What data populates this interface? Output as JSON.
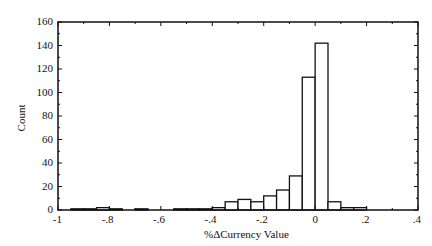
{
  "chart_data": {
    "type": "bar",
    "title": "",
    "xlabel": "%ΔCurrency Value",
    "ylabel": "Count",
    "xlim": [
      -1,
      0.4
    ],
    "ylim": [
      0,
      160
    ],
    "xticks": [
      "-1",
      "-.8",
      "-.6",
      "-.4",
      "-.2",
      "0",
      ".2",
      ".4"
    ],
    "xtick_values": [
      -1,
      -0.8,
      -0.6,
      -0.4,
      -0.2,
      0,
      0.2,
      0.4
    ],
    "yticks": [
      "0",
      "20",
      "40",
      "60",
      "80",
      "100",
      "120",
      "140",
      "160"
    ],
    "ytick_values": [
      0,
      20,
      40,
      60,
      80,
      100,
      120,
      140,
      160
    ],
    "grid": false,
    "legend": null,
    "bin_width": 0.05,
    "bins": [
      {
        "x0": -0.95,
        "x1": -0.9,
        "count": 1
      },
      {
        "x0": -0.9,
        "x1": -0.85,
        "count": 1
      },
      {
        "x0": -0.85,
        "x1": -0.8,
        "count": 2
      },
      {
        "x0": -0.8,
        "x1": -0.75,
        "count": 1
      },
      {
        "x0": -0.7,
        "x1": -0.65,
        "count": 1
      },
      {
        "x0": -0.55,
        "x1": -0.5,
        "count": 1
      },
      {
        "x0": -0.5,
        "x1": -0.45,
        "count": 1
      },
      {
        "x0": -0.45,
        "x1": -0.4,
        "count": 1
      },
      {
        "x0": -0.4,
        "x1": -0.35,
        "count": 2
      },
      {
        "x0": -0.35,
        "x1": -0.3,
        "count": 7
      },
      {
        "x0": -0.3,
        "x1": -0.25,
        "count": 9
      },
      {
        "x0": -0.25,
        "x1": -0.2,
        "count": 7
      },
      {
        "x0": -0.2,
        "x1": -0.15,
        "count": 12
      },
      {
        "x0": -0.15,
        "x1": -0.1,
        "count": 17
      },
      {
        "x0": -0.1,
        "x1": -0.05,
        "count": 29
      },
      {
        "x0": -0.05,
        "x1": 0.0,
        "count": 113
      },
      {
        "x0": 0.0,
        "x1": 0.05,
        "count": 142
      },
      {
        "x0": 0.05,
        "x1": 0.1,
        "count": 7
      },
      {
        "x0": 0.1,
        "x1": 0.15,
        "count": 2
      },
      {
        "x0": 0.15,
        "x1": 0.2,
        "count": 2
      }
    ]
  }
}
